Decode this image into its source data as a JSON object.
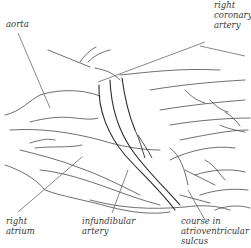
{
  "diagram": {
    "labels": {
      "aorta": "aorta",
      "right_coronary_artery": [
        "right",
        "coronary",
        "artery"
      ],
      "right_atrium": [
        "right",
        "atrium"
      ],
      "infundibular_artery": [
        "infundibular",
        "artery"
      ],
      "course_in_av_sulcus": [
        "course in",
        "atrioventricular",
        "sulcus"
      ]
    },
    "colors": {
      "line": "#3a3a3a",
      "leader": "#555555",
      "background": "#ffffff"
    }
  }
}
